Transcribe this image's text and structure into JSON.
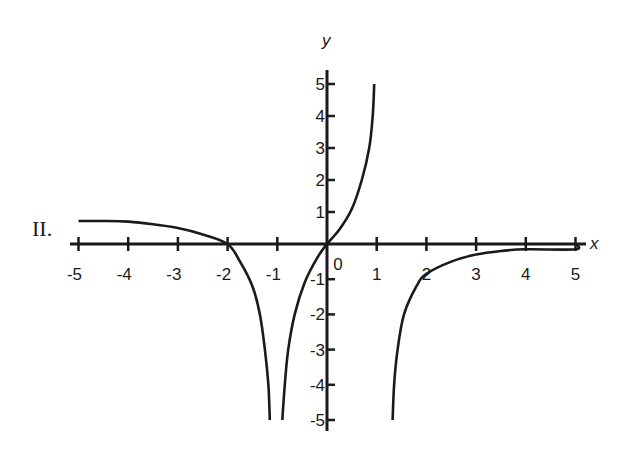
{
  "panel_label": "II.",
  "chart_data": {
    "type": "line",
    "title": "",
    "xlabel": "x",
    "ylabel": "y",
    "xlim": [
      -5,
      5
    ],
    "ylim": [
      -5,
      5
    ],
    "grid": false,
    "legend": null,
    "x_ticks": [
      -5,
      -4,
      -3,
      -2,
      -1,
      0,
      1,
      2,
      3,
      4,
      5
    ],
    "x_tick_labels": [
      "-5",
      "-4",
      "-3",
      "-2",
      "-1",
      "0",
      "1",
      "2",
      "3",
      "4",
      "5"
    ],
    "y_ticks": [
      -5,
      -4,
      -3,
      -2,
      -1,
      1,
      2,
      3,
      4,
      5
    ],
    "y_tick_labels": [
      "-5",
      "-4",
      "-3",
      "-2",
      "-1",
      "1",
      "2",
      "3",
      "4",
      "5"
    ],
    "annotations": [
      "II."
    ],
    "series": [
      {
        "name": "left-branch",
        "points": [
          [
            -5,
            0.72
          ],
          [
            -4.5,
            0.72
          ],
          [
            -4,
            0.7
          ],
          [
            -3.5,
            0.62
          ],
          [
            -3,
            0.5
          ],
          [
            -2.5,
            0.3
          ],
          [
            -2,
            0
          ],
          [
            -1.75,
            -0.5
          ],
          [
            -1.5,
            -1.2
          ],
          [
            -1.35,
            -2.0
          ],
          [
            -1.25,
            -3.0
          ],
          [
            -1.18,
            -4.0
          ],
          [
            -1.15,
            -5.0
          ]
        ]
      },
      {
        "name": "middle-branch",
        "points": [
          [
            -0.9,
            -5.0
          ],
          [
            -0.85,
            -4.0
          ],
          [
            -0.78,
            -3.0
          ],
          [
            -0.65,
            -2.0
          ],
          [
            -0.45,
            -1.1
          ],
          [
            -0.2,
            -0.4
          ],
          [
            0,
            0
          ],
          [
            0.25,
            0.45
          ],
          [
            0.5,
            1.1
          ],
          [
            0.7,
            2.0
          ],
          [
            0.85,
            3.0
          ],
          [
            0.92,
            4.0
          ],
          [
            0.95,
            5.0
          ]
        ]
      },
      {
        "name": "right-branch",
        "points": [
          [
            1.32,
            -5.0
          ],
          [
            1.35,
            -4.0
          ],
          [
            1.42,
            -3.0
          ],
          [
            1.55,
            -2.0
          ],
          [
            1.8,
            -1.2
          ],
          [
            2.0,
            -0.85
          ],
          [
            2.5,
            -0.5
          ],
          [
            3.0,
            -0.3
          ],
          [
            3.5,
            -0.2
          ],
          [
            4.0,
            -0.15
          ],
          [
            5.0,
            -0.15
          ],
          [
            5.0,
            0
          ]
        ]
      }
    ]
  },
  "axis_names": {
    "x": "x",
    "y": "y"
  },
  "colors": {
    "ink": "#1a1a1a",
    "background": "#ffffff"
  }
}
